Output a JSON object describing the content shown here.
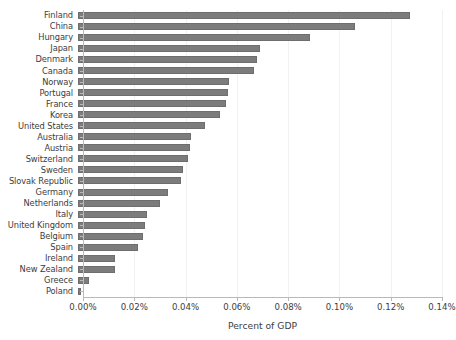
{
  "chart_data": {
    "type": "bar",
    "orientation": "horizontal",
    "title": "",
    "xlabel": "Percent of GDP",
    "ylabel": "",
    "xlim": [
      0,
      0.14
    ],
    "xtick_labels": [
      "0.00%",
      "0.02%",
      "0.04%",
      "0.06%",
      "0.08%",
      "0.10%",
      "0.12%",
      "0.14%"
    ],
    "xtick_values": [
      0,
      0.02,
      0.04,
      0.06,
      0.08,
      0.1,
      0.12,
      0.14
    ],
    "grid": "vertical",
    "legend": "none",
    "bar_color": "#7c7c7c",
    "background_color": "#ffffff",
    "units": "percent",
    "categories": [
      "Finland",
      "China",
      "Hungary",
      "Japan",
      "Denmark",
      "Canada",
      "Norway",
      "Portugal",
      "France",
      "Korea",
      "United States",
      "Australia",
      "Austria",
      "Switzerland",
      "Sweden",
      "Slovak Republic",
      "Germany",
      "Netherlands",
      "Italy",
      "United Kingdom",
      "Belgium",
      "Spain",
      "Ireland",
      "New Zealand",
      "Greece",
      "Poland"
    ],
    "values": [
      0.1294,
      0.108,
      0.0905,
      0.071,
      0.0698,
      0.0686,
      0.0589,
      0.0585,
      0.0578,
      0.0553,
      0.0495,
      0.0441,
      0.0437,
      0.0429,
      0.041,
      0.0402,
      0.0351,
      0.032,
      0.0269,
      0.0261,
      0.0253,
      0.0234,
      0.0145,
      0.0144,
      0.0043,
      0.0012
    ]
  }
}
